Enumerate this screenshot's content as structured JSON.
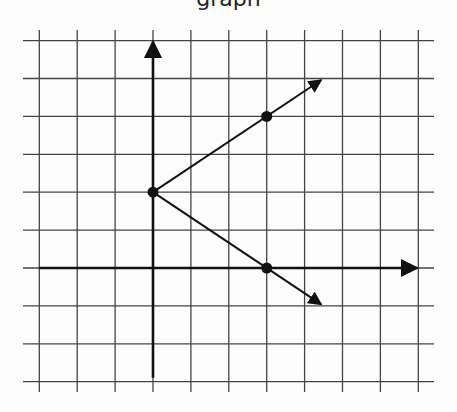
{
  "title_fragment": "graph",
  "diagram": {
    "type": "coordinate-grid-graph",
    "grid": {
      "columns": 11,
      "rows": 10,
      "unit_px": 37.9,
      "line_color": "#444444",
      "axis_color": "#111111"
    },
    "axes": {
      "origin_px": [
        153,
        268
      ],
      "x_axis_range": [
        -3,
        7
      ],
      "y_axis_range": [
        -3,
        6
      ],
      "x_arrow": "right",
      "y_arrow": "up"
    },
    "points": [
      {
        "name": "vertex",
        "x": 0,
        "y": 2
      },
      {
        "name": "upper-point",
        "x": 3,
        "y": 4
      },
      {
        "name": "lower-point",
        "x": 3,
        "y": 0
      }
    ],
    "rays": [
      {
        "name": "upper-ray",
        "from": [
          0,
          2
        ],
        "through": [
          3,
          4
        ]
      },
      {
        "name": "lower-ray",
        "from": [
          0,
          2
        ],
        "through": [
          3,
          0
        ]
      }
    ]
  }
}
